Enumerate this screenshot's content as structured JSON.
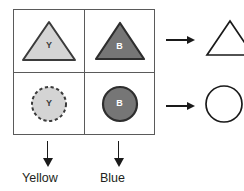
{
  "diagram": {
    "grid": {
      "rows": 2,
      "columns": 2,
      "border_color": "#5a5a5a",
      "cells": [
        {
          "position": "top-left",
          "shape": "triangle",
          "letter": "Y",
          "color_name": "Yellow",
          "fill": "#d4d4d4",
          "stroke": "#3b3b3b",
          "stroke_style": "solid",
          "letter_color": "#3b3b3b"
        },
        {
          "position": "top-right",
          "shape": "triangle",
          "letter": "B",
          "color_name": "Blue",
          "fill": "#767676",
          "stroke": "#2e2e2e",
          "stroke_style": "solid",
          "letter_color": "#ffffff"
        },
        {
          "position": "bottom-left",
          "shape": "circle",
          "letter": "Y",
          "color_name": "Yellow",
          "fill": "#d4d4d4",
          "stroke": "#3b3b3b",
          "stroke_style": "dashed",
          "letter_color": "#3b3b3b"
        },
        {
          "position": "bottom-right",
          "shape": "circle",
          "letter": "B",
          "color_name": "Blue",
          "fill": "#767676",
          "stroke": "#2e2e2e",
          "stroke_style": "solid",
          "letter_color": "#ffffff"
        }
      ]
    },
    "row_outputs": [
      {
        "row": "top",
        "arrow": "right-arrow-icon",
        "shape": "triangle",
        "fill": "none",
        "stroke": "#1a1a1a",
        "letter": ""
      },
      {
        "row": "bottom",
        "arrow": "right-arrow-icon",
        "shape": "circle",
        "fill": "none",
        "stroke": "#1a1a1a",
        "letter": ""
      }
    ],
    "column_outputs": [
      {
        "column": "left",
        "arrow": "down-arrow-icon",
        "label": "Yellow"
      },
      {
        "column": "right",
        "arrow": "down-arrow-icon",
        "label": "Blue"
      }
    ],
    "colors": {
      "grid_line": "#5a5a5a",
      "arrow": "#1a1a1a",
      "text": "#231f20",
      "light_fill": "#d4d4d4",
      "dark_fill": "#767676",
      "background": "#ffffff"
    }
  }
}
